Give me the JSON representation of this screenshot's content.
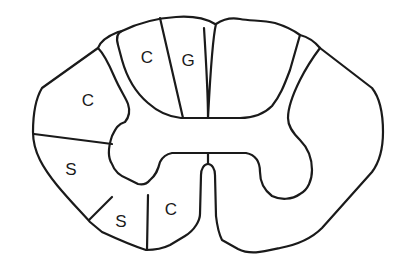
{
  "diagram": {
    "type": "spinal-cord-cross-section",
    "background": "#ffffff",
    "stroke_color": "#1a1a1a",
    "labels": [
      {
        "id": "dorsal-medial",
        "text": "G",
        "x": 188,
        "y": 62
      },
      {
        "id": "dorsal-lateral",
        "text": "C",
        "x": 147,
        "y": 59
      },
      {
        "id": "lateral-upper",
        "text": "C",
        "x": 88,
        "y": 102
      },
      {
        "id": "lateral-lower",
        "text": "S",
        "x": 71,
        "y": 171
      },
      {
        "id": "ventrolateral",
        "text": "S",
        "x": 121,
        "y": 223
      },
      {
        "id": "ventral-medial",
        "text": "C",
        "x": 171,
        "y": 211
      }
    ]
  }
}
